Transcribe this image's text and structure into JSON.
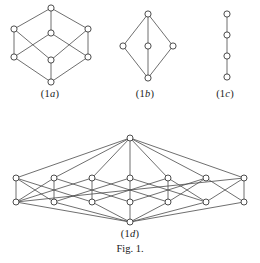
{
  "figure": {
    "caption": "Fig. 1.",
    "caption_top": 243,
    "width": 260,
    "height": 263,
    "colors": {
      "background": "#ffffff",
      "edge": "#4a4a4a",
      "node_fill": "#ffffff",
      "node_stroke": "#3a3a3a",
      "text": "#1a1a1a"
    }
  },
  "panels": [
    {
      "id": "1a",
      "label_prefix": "(1",
      "label_italic": "a",
      "label_suffix": ")",
      "label_text": "(1a)",
      "label_left": 0,
      "label_width": 100,
      "label_top": 88,
      "box": {
        "left": 4,
        "top": 2,
        "width": 94,
        "height": 86
      },
      "node_radius": 3.1,
      "description": "cube-lattice-Q3",
      "nodes": [
        {
          "name": "top",
          "x": 47,
          "y": 6
        },
        {
          "name": "upper-left",
          "x": 10,
          "y": 27
        },
        {
          "name": "upper-center",
          "x": 47,
          "y": 31
        },
        {
          "name": "upper-right",
          "x": 84,
          "y": 27
        },
        {
          "name": "lower-left",
          "x": 10,
          "y": 55
        },
        {
          "name": "lower-center",
          "x": 47,
          "y": 58
        },
        {
          "name": "lower-right",
          "x": 84,
          "y": 55
        },
        {
          "name": "bottom",
          "x": 47,
          "y": 80
        }
      ],
      "edges": [
        [
          0,
          1
        ],
        [
          0,
          2
        ],
        [
          0,
          3
        ],
        [
          1,
          4
        ],
        [
          1,
          5
        ],
        [
          2,
          4
        ],
        [
          2,
          6
        ],
        [
          3,
          5
        ],
        [
          3,
          6
        ],
        [
          4,
          7
        ],
        [
          5,
          7
        ],
        [
          6,
          7
        ]
      ]
    },
    {
      "id": "1b",
      "label_prefix": "(1",
      "label_italic": "b",
      "label_suffix": ")",
      "label_text": "(1b)",
      "label_left": 100,
      "label_width": 90,
      "label_top": 88,
      "box": {
        "left": 117,
        "top": 8,
        "width": 62,
        "height": 76
      },
      "node_radius": 3.1,
      "description": "diamond-lattice-with-center",
      "nodes": [
        {
          "name": "top",
          "x": 31,
          "y": 6
        },
        {
          "name": "left",
          "x": 6,
          "y": 38
        },
        {
          "name": "center",
          "x": 31,
          "y": 38
        },
        {
          "name": "right",
          "x": 56,
          "y": 38
        },
        {
          "name": "bottom",
          "x": 31,
          "y": 70
        }
      ],
      "edges": [
        [
          0,
          1
        ],
        [
          0,
          2
        ],
        [
          0,
          3
        ],
        [
          1,
          4
        ],
        [
          2,
          4
        ],
        [
          3,
          4
        ]
      ]
    },
    {
      "id": "1c",
      "label_prefix": "(1",
      "label_italic": "c",
      "label_suffix": ")",
      "label_text": "(1c)",
      "label_left": 190,
      "label_width": 70,
      "label_top": 88,
      "box": {
        "left": 215,
        "top": 8,
        "width": 24,
        "height": 76
      },
      "node_radius": 3.1,
      "description": "chain-lattice-4-elements",
      "nodes": [
        {
          "name": "top",
          "x": 12,
          "y": 6
        },
        {
          "name": "upper-middle",
          "x": 12,
          "y": 27
        },
        {
          "name": "lower-middle",
          "x": 12,
          "y": 48
        },
        {
          "name": "bottom",
          "x": 12,
          "y": 69
        }
      ],
      "edges": [
        [
          0,
          1
        ],
        [
          1,
          2
        ],
        [
          2,
          3
        ]
      ]
    },
    {
      "id": "1d",
      "label_prefix": "(1",
      "label_italic": "d",
      "label_suffix": ")",
      "label_text": "(1d)",
      "label_left": 0,
      "label_width": 260,
      "label_top": 228,
      "box": {
        "left": 6,
        "top": 132,
        "width": 248,
        "height": 96
      },
      "node_radius": 3.0,
      "description": "hypercube-lattice-Q4",
      "nodes": [
        {
          "name": "apex",
          "x": 124,
          "y": 6
        },
        {
          "name": "r1-n1",
          "x": 10,
          "y": 46
        },
        {
          "name": "r1-n2",
          "x": 48,
          "y": 46
        },
        {
          "name": "r1-n3",
          "x": 86,
          "y": 46
        },
        {
          "name": "r1-n4",
          "x": 124,
          "y": 46
        },
        {
          "name": "r1-n5",
          "x": 162,
          "y": 46
        },
        {
          "name": "r1-n6",
          "x": 200,
          "y": 46
        },
        {
          "name": "r1-n7",
          "x": 238,
          "y": 46
        },
        {
          "name": "r2-n1",
          "x": 10,
          "y": 70
        },
        {
          "name": "r2-n2",
          "x": 48,
          "y": 70
        },
        {
          "name": "r2-n3",
          "x": 86,
          "y": 70
        },
        {
          "name": "r2-n4",
          "x": 124,
          "y": 70
        },
        {
          "name": "r2-n5",
          "x": 162,
          "y": 70
        },
        {
          "name": "r2-n6",
          "x": 200,
          "y": 70
        },
        {
          "name": "r2-n7",
          "x": 238,
          "y": 70
        },
        {
          "name": "nadir",
          "x": 124,
          "y": 90
        }
      ],
      "edges": [
        [
          0,
          1
        ],
        [
          0,
          2
        ],
        [
          0,
          3
        ],
        [
          0,
          4
        ],
        [
          0,
          5
        ],
        [
          0,
          6
        ],
        [
          0,
          7
        ],
        [
          1,
          8
        ],
        [
          1,
          9
        ],
        [
          1,
          10
        ],
        [
          2,
          8
        ],
        [
          2,
          9
        ],
        [
          2,
          11
        ],
        [
          3,
          8
        ],
        [
          3,
          10
        ],
        [
          3,
          12
        ],
        [
          4,
          9
        ],
        [
          4,
          11
        ],
        [
          4,
          13
        ],
        [
          5,
          10
        ],
        [
          5,
          12
        ],
        [
          5,
          13
        ],
        [
          6,
          11
        ],
        [
          6,
          12
        ],
        [
          6,
          14
        ],
        [
          7,
          13
        ],
        [
          7,
          14
        ],
        [
          7,
          8
        ],
        [
          8,
          15
        ],
        [
          9,
          15
        ],
        [
          10,
          15
        ],
        [
          11,
          15
        ],
        [
          12,
          15
        ],
        [
          13,
          15
        ],
        [
          14,
          15
        ]
      ]
    }
  ]
}
